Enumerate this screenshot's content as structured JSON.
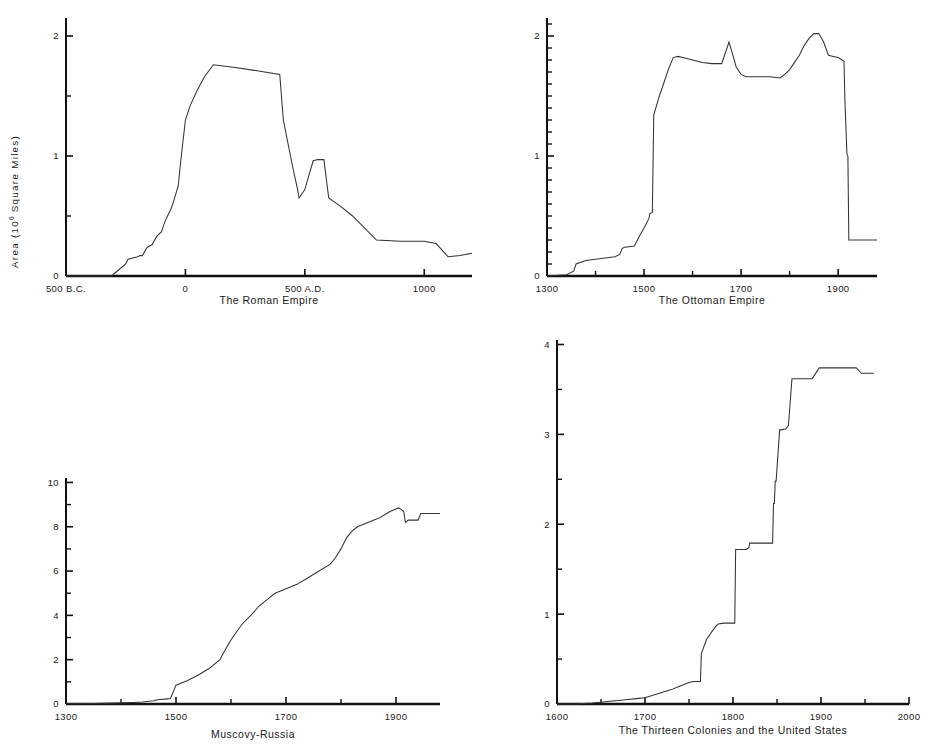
{
  "figure": {
    "y_axis_label_prefix": "Area  (10",
    "y_axis_label_exponent": "6",
    "y_axis_label_suffix": " Square Miles)",
    "background_color": "#ffffff",
    "line_color": "#333333",
    "axis_color": "#111111"
  },
  "chart_data": [
    {
      "id": "roman",
      "type": "line",
      "title": "The Roman Empire",
      "xlabel": "",
      "ylabel": "Area (10^6 Square Miles)",
      "xlim": [
        -500,
        1200
      ],
      "ylim": [
        0,
        2.15
      ],
      "grid": false,
      "legend": "none",
      "xticks": [
        -500,
        0,
        500,
        1000
      ],
      "xticklabels": [
        "500 B.C.",
        "0",
        "500 A.D.",
        "1000"
      ],
      "xticks_minor": [],
      "yticks": [
        0,
        1,
        2
      ],
      "yticklabels": [
        "0",
        "1",
        "2"
      ],
      "yticks_minor": [
        0.5,
        1.5
      ],
      "x": [
        -500,
        -310,
        -280,
        -250,
        -240,
        -220,
        -200,
        -190,
        -180,
        -160,
        -150,
        -140,
        -120,
        -100,
        -90,
        -80,
        -60,
        -50,
        -30,
        -20,
        0,
        20,
        50,
        80,
        117,
        200,
        300,
        395,
        410,
        450,
        470,
        476,
        500,
        520,
        535,
        555,
        565,
        580,
        600,
        650,
        700,
        800,
        900,
        1000,
        1050,
        1100,
        1150,
        1200
      ],
      "y": [
        0,
        0,
        0.05,
        0.1,
        0.14,
        0.15,
        0.16,
        0.17,
        0.17,
        0.24,
        0.25,
        0.26,
        0.33,
        0.37,
        0.43,
        0.48,
        0.56,
        0.62,
        0.75,
        0.95,
        1.3,
        1.42,
        1.55,
        1.66,
        1.76,
        1.74,
        1.71,
        1.68,
        1.3,
        0.9,
        0.72,
        0.65,
        0.72,
        0.86,
        0.96,
        0.97,
        0.97,
        0.97,
        0.65,
        0.58,
        0.5,
        0.3,
        0.29,
        0.29,
        0.27,
        0.16,
        0.17,
        0.19
      ]
    },
    {
      "id": "ottoman",
      "type": "line",
      "title": "The Ottoman Empire",
      "xlabel": "",
      "ylabel": "Area (10^6 Square Miles)",
      "xlim": [
        1300,
        1980
      ],
      "ylim": [
        0,
        2.15
      ],
      "grid": false,
      "legend": "none",
      "xticks": [
        1300,
        1500,
        1700,
        1900
      ],
      "xticklabels": [
        "1300",
        "1500",
        "1700",
        "1900"
      ],
      "xticks_minor": [
        1400,
        1600,
        1800
      ],
      "yticks": [
        0,
        1,
        2
      ],
      "yticklabels": [
        "0",
        "1",
        "2"
      ],
      "yticks_minor": [
        0.1,
        0.2,
        0.3,
        0.4,
        0.5,
        0.6,
        0.7,
        0.8,
        0.9,
        1.1,
        1.2,
        1.3,
        1.4,
        1.5,
        1.6,
        1.7,
        1.8,
        1.9,
        2.1
      ],
      "x": [
        1300,
        1340,
        1355,
        1360,
        1380,
        1400,
        1420,
        1440,
        1450,
        1455,
        1460,
        1480,
        1490,
        1500,
        1510,
        1512,
        1517,
        1520,
        1530,
        1540,
        1550,
        1560,
        1570,
        1580,
        1600,
        1620,
        1640,
        1660,
        1675,
        1683,
        1690,
        1700,
        1710,
        1720,
        1740,
        1760,
        1780,
        1790,
        1800,
        1810,
        1820,
        1830,
        1840,
        1850,
        1860,
        1870,
        1878,
        1880,
        1890,
        1900,
        1908,
        1912,
        1913,
        1914,
        1918,
        1920,
        1922,
        1980
      ],
      "y": [
        0,
        0.01,
        0.04,
        0.1,
        0.13,
        0.14,
        0.15,
        0.16,
        0.18,
        0.23,
        0.24,
        0.25,
        0.33,
        0.4,
        0.48,
        0.52,
        0.53,
        1.34,
        1.48,
        1.6,
        1.72,
        1.82,
        1.83,
        1.82,
        1.8,
        1.78,
        1.77,
        1.77,
        1.95,
        1.84,
        1.74,
        1.68,
        1.66,
        1.66,
        1.66,
        1.66,
        1.65,
        1.68,
        1.72,
        1.78,
        1.84,
        1.92,
        1.98,
        2.02,
        2.02,
        1.95,
        1.86,
        1.84,
        1.83,
        1.82,
        1.8,
        1.79,
        1.6,
        1.45,
        1.02,
        1.0,
        0.3,
        0.3
      ]
    },
    {
      "id": "russia",
      "type": "line",
      "title": "Muscovy-Russia",
      "xlabel": "",
      "ylabel": "Area (10^6 Square Miles)",
      "xlim": [
        1300,
        1980
      ],
      "ylim": [
        0,
        10.2
      ],
      "grid": false,
      "legend": "none",
      "xticks": [
        1300,
        1500,
        1700,
        1900
      ],
      "xticklabels": [
        "1300",
        "1500",
        "1700",
        "1900"
      ],
      "xticks_minor": [
        1400,
        1600,
        1800
      ],
      "yticks": [
        0,
        2,
        4,
        6,
        8,
        10
      ],
      "yticklabels": [
        "0",
        "2",
        "4",
        "6",
        "8",
        "10"
      ],
      "yticks_minor": [
        1,
        3,
        5,
        7,
        9
      ],
      "x": [
        1300,
        1350,
        1400,
        1420,
        1440,
        1450,
        1460,
        1462,
        1470,
        1480,
        1490,
        1500,
        1520,
        1540,
        1560,
        1580,
        1584,
        1600,
        1620,
        1640,
        1650,
        1660,
        1670,
        1680,
        1690,
        1700,
        1720,
        1740,
        1760,
        1780,
        1790,
        1800,
        1810,
        1820,
        1830,
        1840,
        1850,
        1860,
        1870,
        1880,
        1890,
        1900,
        1905,
        1914,
        1917,
        1920,
        1922,
        1930,
        1940,
        1945,
        1960,
        1980
      ],
      "y": [
        0.01,
        0.02,
        0.05,
        0.07,
        0.09,
        0.12,
        0.15,
        0.17,
        0.2,
        0.22,
        0.25,
        0.85,
        1.05,
        1.3,
        1.6,
        2.0,
        2.2,
        2.9,
        3.6,
        4.1,
        4.4,
        4.6,
        4.8,
        5.0,
        5.1,
        5.2,
        5.4,
        5.7,
        6.0,
        6.3,
        6.6,
        7.0,
        7.5,
        7.8,
        8.0,
        8.1,
        8.2,
        8.3,
        8.4,
        8.55,
        8.7,
        8.8,
        8.85,
        8.7,
        8.2,
        8.25,
        8.3,
        8.3,
        8.3,
        8.6,
        8.6,
        8.6
      ]
    },
    {
      "id": "us",
      "type": "line",
      "title": "The Thirteen Colonies and the United States",
      "xlabel": "",
      "ylabel": "Area (10^6 Square Miles)",
      "xlim": [
        1600,
        2000
      ],
      "ylim": [
        0,
        4.05
      ],
      "grid": false,
      "legend": "none",
      "xticks": [
        1600,
        1700,
        1800,
        1900,
        2000
      ],
      "xticklabels": [
        "1600",
        "1700",
        "1800",
        "1900",
        "2000"
      ],
      "xticks_minor": [
        1650,
        1750,
        1850,
        1950
      ],
      "yticks": [
        0,
        1,
        2,
        3,
        4
      ],
      "yticklabels": [
        "0",
        "1",
        "2",
        "3",
        "4"
      ],
      "yticks_minor": [
        0.5,
        1.5,
        2.5,
        3.5
      ],
      "x": [
        1600,
        1620,
        1640,
        1650,
        1660,
        1670,
        1680,
        1690,
        1700,
        1710,
        1720,
        1730,
        1740,
        1750,
        1755,
        1760,
        1763,
        1764,
        1770,
        1780,
        1783,
        1790,
        1800,
        1802,
        1803,
        1804,
        1810,
        1815,
        1818,
        1819,
        1820,
        1835,
        1840,
        1845,
        1846,
        1847,
        1848,
        1849,
        1853,
        1854,
        1860,
        1863,
        1867,
        1890,
        1898,
        1899,
        1940,
        1946,
        1950,
        1960
      ],
      "y": [
        0,
        0.0,
        0.01,
        0.02,
        0.03,
        0.04,
        0.05,
        0.06,
        0.07,
        0.1,
        0.13,
        0.16,
        0.2,
        0.24,
        0.25,
        0.25,
        0.25,
        0.56,
        0.72,
        0.86,
        0.89,
        0.9,
        0.9,
        0.9,
        1.72,
        1.72,
        1.72,
        1.72,
        1.74,
        1.79,
        1.79,
        1.79,
        1.79,
        1.79,
        2.23,
        2.23,
        2.48,
        2.48,
        3.05,
        3.05,
        3.06,
        3.1,
        3.62,
        3.62,
        3.74,
        3.74,
        3.74,
        3.68,
        3.68,
        3.68
      ]
    }
  ]
}
